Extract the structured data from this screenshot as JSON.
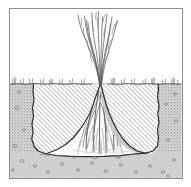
{
  "figure": {
    "kind": "scientific-illustration",
    "caption": "",
    "title": "",
    "frame": {
      "visible": true,
      "x": 9,
      "y": 8,
      "width": 173,
      "height": 170,
      "stroke_color": "#8d8d8d",
      "stroke_width": 1
    },
    "canvas": {
      "width": 191,
      "height": 187,
      "background_color": "#ffffff"
    },
    "colors": {
      "ink": "#2a2a2a",
      "line_mid": "#5d5d5d",
      "line_light": "#9a9a9a",
      "hatch": "#7c7c7c",
      "stipple": "#8a8a8a",
      "soil_tint": "#d9d9d9",
      "air": "#ffffff",
      "root_void": "#fbfbfb",
      "frame": "#8d8d8d"
    },
    "regions": [
      {
        "name": "air-above-ground",
        "label": "Air / above-ground space",
        "fill": "#ffffff",
        "texture": "none"
      },
      {
        "name": "hatched-soil-block",
        "label": "Excavated soil block (diagonal hatching)",
        "fill": "#ffffff",
        "texture": "diagonal-hatch",
        "hatch_angle_deg": 45,
        "hatch_spacing_px": 3
      },
      {
        "name": "stippled-subsoil",
        "label": "Surrounding subsoil / gravel (stipple)",
        "fill": "#d9d9d9",
        "texture": "stipple-dots",
        "pebbles": true
      },
      {
        "name": "root-void-cone",
        "label": "Conical root zone (cleared of soil)",
        "fill": "#fbfbfb",
        "texture": "none"
      }
    ],
    "features": [
      {
        "name": "ground-surface-line",
        "label": "Ground surface",
        "y": 84
      },
      {
        "name": "trench-floor",
        "label": "Trench floor",
        "y": 154
      },
      {
        "name": "shoot-cluster",
        "label": "Grass shoots / culms",
        "count": 11,
        "top_y": 11,
        "base_y": 86
      },
      {
        "name": "root-cone",
        "label": "Fibrous root cone",
        "apex_y": 86,
        "base_y": 154,
        "half_width_px": 48
      },
      {
        "name": "surface-stubble",
        "label": "Surface stubble and small tufts",
        "count": 26
      },
      {
        "name": "pebbles",
        "label": "Pebbles in subsoil",
        "count": 22
      }
    ]
  },
  "chart_data": {
    "type": "diagram",
    "xlabel": "",
    "ylabel": "",
    "legend": []
  }
}
